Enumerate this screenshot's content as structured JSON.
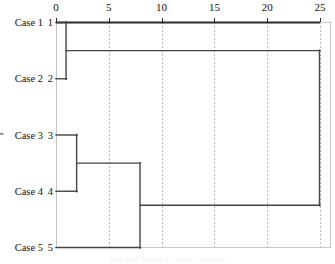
{
  "figure": {
    "title": "",
    "y_axis_title": "Y",
    "caption": "Rescaled Distance Cluster Combine"
  },
  "axis": {
    "label": "Rescaled Distance Cluster Combine",
    "ticks": [
      {
        "value": 0,
        "label": "0"
      },
      {
        "value": 5,
        "label": "5"
      },
      {
        "value": 10,
        "label": "10"
      },
      {
        "value": 15,
        "label": "15"
      },
      {
        "value": 20,
        "label": "20"
      },
      {
        "value": 25,
        "label": "25"
      }
    ]
  },
  "leaves": [
    {
      "name": "Case 1",
      "num": "1"
    },
    {
      "name": "Case 2",
      "num": "2"
    },
    {
      "name": "Case 3",
      "num": "3"
    },
    {
      "name": "Case 4",
      "num": "4"
    },
    {
      "name": "Case 5",
      "num": "5"
    }
  ],
  "colors": {
    "line": "#444444",
    "grid": "#bdbdbd",
    "axis": "#2b2b2b",
    "text": "#101010",
    "background": "#ffffff"
  },
  "chart_data": {
    "type": "line",
    "subtype": "dendrogram",
    "title": "",
    "xlabel": "Rescaled Distance Cluster Combine",
    "ylabel": "Y",
    "xlim": [
      0,
      25
    ],
    "xticks": [
      0,
      5,
      10,
      15,
      20,
      25
    ],
    "grid": true,
    "orientation": "horizontal",
    "legend": "none",
    "leaf_labels": [
      "Case 1",
      "Case 2",
      "Case 3",
      "Case 4",
      "Case 5"
    ],
    "leaf_ids": [
      1,
      2,
      3,
      4,
      5
    ],
    "leaf_order": [
      1,
      2,
      3,
      4,
      5
    ],
    "merges": [
      {
        "id": "m1",
        "members": [
          1,
          2
        ],
        "distance": 1,
        "label": "Case 1 + Case 2"
      },
      {
        "id": "m2",
        "members": [
          3,
          4
        ],
        "distance": 2,
        "label": "Case 3 + Case 4"
      },
      {
        "id": "m3",
        "members": [
          3,
          4,
          5
        ],
        "distance": 8,
        "label": "(Case 3 + Case 4) + Case 5"
      },
      {
        "id": "m4",
        "members": [
          1,
          2,
          3,
          4,
          5
        ],
        "distance": 25,
        "label": "All cases"
      }
    ]
  }
}
